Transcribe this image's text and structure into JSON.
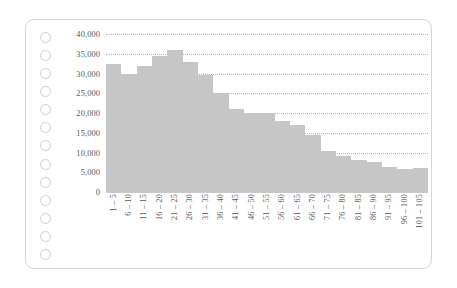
{
  "page": {
    "punch_hole_count": 13,
    "punch_hole_icon": "circle-hole-icon",
    "card_border_color": "#d8d8d8",
    "background_color": "#ffffff"
  },
  "chart_data": {
    "type": "bar",
    "title": "",
    "subtitle": "",
    "xlabel": "",
    "ylabel": "",
    "grid": true,
    "legend": false,
    "legend_position": "none",
    "bar_color": "#c6c6c6",
    "gridline_color": "#b9b9b9",
    "axis_text_color": "#58595b",
    "ylim": [
      0,
      40000
    ],
    "y_ticks": [
      0,
      5000,
      10000,
      15000,
      20000,
      25000,
      30000,
      35000,
      40000
    ],
    "y_tick_labels": [
      "0",
      "5,000",
      "10,000",
      "15,000",
      "20,000",
      "25,000",
      "30,000",
      "35,000",
      "40,000"
    ],
    "categories": [
      "1 – 5",
      "6 – 10",
      "11 – 15",
      "16 – 20",
      "21 – 25",
      "26 – 30",
      "31 – 35",
      "36 – 40",
      "41 – 45",
      "46 – 50",
      "51 – 55",
      "56 – 60",
      "61 – 65",
      "66 – 70",
      "71 – 75",
      "76 – 80",
      "81 – 85",
      "86 – 90",
      "91 – 95",
      "96 – 100",
      "101 – 105"
    ],
    "values": [
      32500,
      30000,
      32000,
      34500,
      36000,
      33000,
      29500,
      25000,
      21000,
      20000,
      20100,
      18000,
      17000,
      14500,
      10300,
      9000,
      8200,
      7500,
      6300,
      5800,
      6200
    ]
  }
}
